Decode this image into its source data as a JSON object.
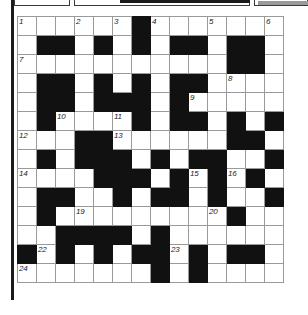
{
  "puzzle": {
    "type": "crossword-grid",
    "title": "Crossword puzzle grid",
    "columns": 14,
    "rows": 14,
    "cell_size_px": 19,
    "colors": {
      "block": "#111111",
      "cell": "#ffffff",
      "grid_line": "#9a9a9a",
      "number_text": "#1a1a1a",
      "furniture": "#1b1b1b"
    },
    "legend": {
      "block_symbol": "#",
      "open_symbol": "."
    },
    "grid": [
      "......#.......",
      ".##.#.#.##.##.",
      "...........##.",
      ".##.#.#.##....",
      ".##.###.#.....",
      ".#....#.##.#.#",
      "...##......##.",
      ".#.###.#.##..#",
      "....###.#.#.#.",
      ".##..#.##.#..#",
      ".#.........#..",
      "..####.#......",
      "#.#.#.##.#.##.",
      ".......#.#...."
    ],
    "numbers": [
      {
        "n": 1,
        "row": 0,
        "col": 0
      },
      {
        "n": 2,
        "row": 0,
        "col": 3
      },
      {
        "n": 3,
        "row": 0,
        "col": 5
      },
      {
        "n": 4,
        "row": 0,
        "col": 7
      },
      {
        "n": 5,
        "row": 0,
        "col": 10
      },
      {
        "n": 6,
        "row": 0,
        "col": 13
      },
      {
        "n": 7,
        "row": 2,
        "col": 0
      },
      {
        "n": 8,
        "row": 3,
        "col": 11
      },
      {
        "n": 9,
        "row": 4,
        "col": 9
      },
      {
        "n": 10,
        "row": 5,
        "col": 2
      },
      {
        "n": 11,
        "row": 5,
        "col": 5
      },
      {
        "n": 12,
        "row": 6,
        "col": 0
      },
      {
        "n": 13,
        "row": 6,
        "col": 5
      },
      {
        "n": 14,
        "row": 8,
        "col": 0
      },
      {
        "n": 15,
        "row": 8,
        "col": 9
      },
      {
        "n": 16,
        "row": 8,
        "col": 11
      },
      {
        "n": 17,
        "row": 9,
        "col": 5
      },
      {
        "n": 18,
        "row": 9,
        "col": 13
      },
      {
        "n": 19,
        "row": 10,
        "col": 3
      },
      {
        "n": 20,
        "row": 10,
        "col": 10
      },
      {
        "n": 21,
        "row": 12,
        "col": 0
      },
      {
        "n": 22,
        "row": 12,
        "col": 1
      },
      {
        "n": 23,
        "row": 12,
        "col": 8
      },
      {
        "n": 24,
        "row": 13,
        "col": 0
      },
      {
        "n": 25,
        "row": 13,
        "col": 9
      }
    ]
  }
}
